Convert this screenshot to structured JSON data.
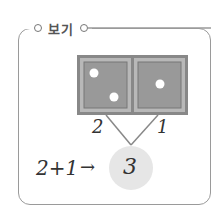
{
  "title": "보기",
  "domino": {
    "left_pips": 2,
    "right_pips": 1
  },
  "labels": {
    "left": "2",
    "right": "1"
  },
  "equation": {
    "expression": "2+1",
    "arrow": "→",
    "result": "3"
  },
  "colors": {
    "domino_outer": "#8a8a8a",
    "domino_face": "#9c9c9c",
    "pip": "#ffffff",
    "circle": "#e8e8e8",
    "border": "#9a9a9a"
  }
}
